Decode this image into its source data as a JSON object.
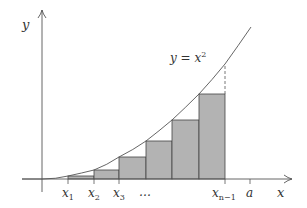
{
  "diagram": {
    "curve_label": {
      "base": "y = x",
      "sup": "2"
    },
    "axis_labels": {
      "x": "x",
      "y": "y"
    },
    "tick_labels": [
      {
        "base": "x",
        "sub": "1"
      },
      {
        "base": "x",
        "sub": "2"
      },
      {
        "base": "x",
        "sub": "3"
      },
      {
        "base": "…",
        "sub": ""
      },
      {
        "base": "x",
        "sub": "n−1"
      },
      {
        "base": "a",
        "sub": ""
      }
    ],
    "colors": {
      "axis": "#555555",
      "curve": "#555555",
      "rect_fill": "#b3b3b3",
      "rect_stroke": "#444444"
    },
    "rectangles": [
      {
        "x0": 68,
        "x1": 94,
        "top": 176
      },
      {
        "x0": 94,
        "x1": 119,
        "top": 170
      },
      {
        "x0": 119,
        "x1": 146,
        "top": 157
      },
      {
        "x0": 146,
        "x1": 172,
        "top": 141
      },
      {
        "x0": 172,
        "x1": 199,
        "top": 120
      },
      {
        "x0": 199,
        "x1": 225,
        "top": 94
      }
    ]
  }
}
